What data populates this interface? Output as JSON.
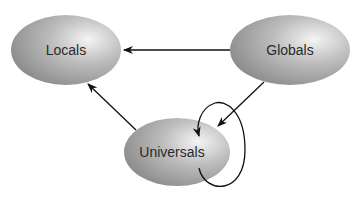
{
  "diagram": {
    "nodes": [
      {
        "id": "locals",
        "label": "Locals"
      },
      {
        "id": "globals",
        "label": "Globals"
      },
      {
        "id": "universals",
        "label": "Universals"
      }
    ],
    "edges": [
      {
        "from": "globals",
        "to": "locals"
      },
      {
        "from": "globals",
        "to": "universals"
      },
      {
        "from": "universals",
        "to": "locals"
      },
      {
        "from": "universals",
        "to": "universals"
      }
    ]
  }
}
